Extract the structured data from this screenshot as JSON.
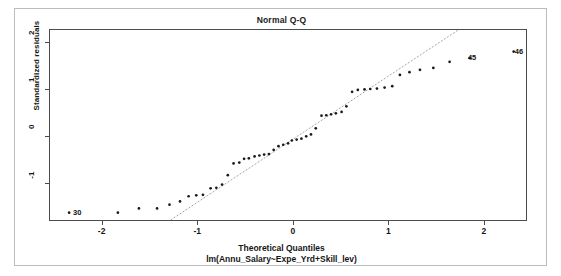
{
  "figure": {
    "title": "Normal Q-Q",
    "xlabel": "Theoretical Quantiles",
    "xsublabel": "lm(Annu_Salary~Expe_Yrd+Skill_lev)",
    "ylabel": "Standardized residuals"
  },
  "chart_data": {
    "type": "scatter",
    "title": "Normal Q-Q",
    "subtitle": "lm(Annu_Salary~Expe_Yrd+Skill_lev)",
    "xlabel": "Theoretical Quantiles",
    "ylabel": "Standardized residuals",
    "xlim": [
      -2.55,
      2.45
    ],
    "ylim": [
      -1.82,
      2.28
    ],
    "xticks": [
      -2,
      -1,
      0,
      1,
      2
    ],
    "yticks": [
      -1,
      0,
      1,
      2
    ],
    "grid": false,
    "legend": null,
    "reference_line": {
      "style": "dotted",
      "color": "#999999",
      "x": [
        -1.32,
        1.72
      ],
      "y": [
        -1.82,
        2.28
      ]
    },
    "point_color": "#1a1a1a",
    "point_labels": [
      {
        "text": "30",
        "x": -2.35,
        "y": -1.62
      },
      {
        "text": "45",
        "x": 1.78,
        "y": 1.68
      },
      {
        "text": "46",
        "x": 2.27,
        "y": 1.82
      }
    ],
    "points": [
      {
        "x": -2.35,
        "y": -1.62
      },
      {
        "x": -1.84,
        "y": -1.62
      },
      {
        "x": -1.62,
        "y": -1.53
      },
      {
        "x": -1.43,
        "y": -1.53
      },
      {
        "x": -1.3,
        "y": -1.45
      },
      {
        "x": -1.19,
        "y": -1.38
      },
      {
        "x": -1.1,
        "y": -1.27
      },
      {
        "x": -1.02,
        "y": -1.25
      },
      {
        "x": -0.95,
        "y": -1.24
      },
      {
        "x": -0.87,
        "y": -1.1
      },
      {
        "x": -0.81,
        "y": -1.09
      },
      {
        "x": -0.75,
        "y": -1.02
      },
      {
        "x": -0.69,
        "y": -0.82
      },
      {
        "x": -0.63,
        "y": -0.57
      },
      {
        "x": -0.57,
        "y": -0.55
      },
      {
        "x": -0.52,
        "y": -0.47
      },
      {
        "x": -0.47,
        "y": -0.46
      },
      {
        "x": -0.41,
        "y": -0.42
      },
      {
        "x": -0.36,
        "y": -0.4
      },
      {
        "x": -0.31,
        "y": -0.38
      },
      {
        "x": -0.26,
        "y": -0.37
      },
      {
        "x": -0.21,
        "y": -0.28
      },
      {
        "x": -0.16,
        "y": -0.2
      },
      {
        "x": -0.11,
        "y": -0.17
      },
      {
        "x": -0.06,
        "y": -0.14
      },
      {
        "x": -0.02,
        "y": -0.08
      },
      {
        "x": 0.03,
        "y": -0.06
      },
      {
        "x": 0.08,
        "y": -0.04
      },
      {
        "x": 0.13,
        "y": 0.01
      },
      {
        "x": 0.18,
        "y": 0.05
      },
      {
        "x": 0.23,
        "y": 0.18
      },
      {
        "x": 0.29,
        "y": 0.45
      },
      {
        "x": 0.34,
        "y": 0.46
      },
      {
        "x": 0.39,
        "y": 0.48
      },
      {
        "x": 0.44,
        "y": 0.5
      },
      {
        "x": 0.5,
        "y": 0.53
      },
      {
        "x": 0.55,
        "y": 0.65
      },
      {
        "x": 0.61,
        "y": 0.96
      },
      {
        "x": 0.67,
        "y": 1.0
      },
      {
        "x": 0.74,
        "y": 1.01
      },
      {
        "x": 0.8,
        "y": 1.02
      },
      {
        "x": 0.87,
        "y": 1.03
      },
      {
        "x": 0.95,
        "y": 1.05
      },
      {
        "x": 1.03,
        "y": 1.08
      },
      {
        "x": 1.11,
        "y": 1.32
      },
      {
        "x": 1.21,
        "y": 1.38
      },
      {
        "x": 1.32,
        "y": 1.43
      },
      {
        "x": 1.46,
        "y": 1.47
      },
      {
        "x": 1.63,
        "y": 1.6
      },
      {
        "x": 1.84,
        "y": 1.68
      },
      {
        "x": 2.3,
        "y": 1.82
      }
    ]
  }
}
